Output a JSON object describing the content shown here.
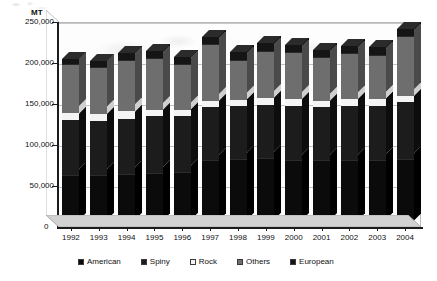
{
  "chart_data": {
    "type": "bar",
    "stacked": true,
    "three_d": true,
    "title": "",
    "subtitle": "",
    "xlabel": "",
    "ylabel": "MT",
    "unit_label": "MT",
    "categories": [
      "1992",
      "1993",
      "1994",
      "1995",
      "1996",
      "1997",
      "1998",
      "1999",
      "2000",
      "2001",
      "2002",
      "2003",
      "2004"
    ],
    "ylim": [
      0,
      250000
    ],
    "y_ticks": [
      0,
      50000,
      100000,
      150000,
      200000,
      250000
    ],
    "y_tick_labels": [
      "0",
      "50,000",
      "100,000",
      "150,000",
      "200,000",
      "250,000"
    ],
    "grid": true,
    "legend_position": "bottom",
    "series": [
      {
        "name": "American",
        "color": "#0b0b0b",
        "values": [
          62000,
          62000,
          64000,
          65000,
          66000,
          80000,
          82000,
          83000,
          80000,
          80000,
          80000,
          80000,
          82000
        ]
      },
      {
        "name": "Spiny",
        "color": "#1c1c1c",
        "values": [
          68000,
          67000,
          68000,
          70000,
          69000,
          66000,
          65000,
          66000,
          68000,
          66000,
          68000,
          68000,
          70000
        ]
      },
      {
        "name": "Rock",
        "color": "#f4f4f4",
        "values": [
          9000,
          9000,
          9000,
          8000,
          8000,
          8000,
          8000,
          8000,
          8000,
          8000,
          8000,
          8000,
          8000
        ]
      },
      {
        "name": "Others",
        "color": "#6e6e6e",
        "values": [
          58000,
          56000,
          62000,
          62000,
          55000,
          68000,
          48000,
          57000,
          56000,
          52000,
          55000,
          53000,
          72000
        ]
      },
      {
        "name": "European",
        "color": "#151515",
        "values": [
          8000,
          8000,
          9000,
          10000,
          9000,
          10000,
          10000,
          10000,
          10000,
          10000,
          10000,
          10000,
          10000
        ]
      }
    ],
    "totals": [
      205000,
      202000,
      212000,
      215000,
      207000,
      232000,
      213000,
      224000,
      222000,
      216000,
      221000,
      219000,
      242000
    ]
  },
  "legend": {
    "items": [
      {
        "label": "American",
        "color": "#0b0b0b"
      },
      {
        "label": "Spiny",
        "color": "#1c1c1c"
      },
      {
        "label": "Rock",
        "color": "#f4f4f4"
      },
      {
        "label": "Others",
        "color": "#6e6e6e"
      },
      {
        "label": "European",
        "color": "#151515"
      }
    ]
  },
  "axis": {
    "zero_label": "0"
  }
}
